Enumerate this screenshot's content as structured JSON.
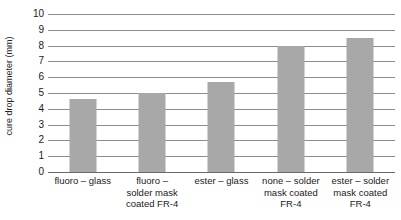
{
  "chart_data": {
    "type": "bar",
    "title": "",
    "xlabel": "",
    "ylabel": "cure drop diameter (mm)",
    "ylim": [
      0,
      10
    ],
    "ytick_step": 1,
    "grid": true,
    "legend": "none",
    "categories": [
      "fluoro – glass",
      "fluoro – solder mask coated FR-4",
      "ester – glass",
      "none – solder mask coated FR-4",
      "ester – solder mask coated FR-4"
    ],
    "category_lines": [
      [
        "fluoro – glass"
      ],
      [
        "fluoro –",
        "solder mask",
        "coated FR-4"
      ],
      [
        "ester – glass"
      ],
      [
        "none – solder",
        "mask coated",
        "FR-4"
      ],
      [
        "ester – solder",
        "mask coated",
        "FR-4"
      ]
    ],
    "values": [
      4.6,
      5.0,
      5.7,
      8.0,
      8.5
    ],
    "ytick_labels": [
      "10",
      "9",
      "8",
      "7",
      "6",
      "5",
      "4",
      "3",
      "2",
      "1",
      "0"
    ],
    "colors": {
      "bar_fill": "#a8a8a8",
      "gridline": "#8d8d8d",
      "axis": "#6a6a6a",
      "text": "#1a1a1a",
      "background": "#ffffff"
    }
  }
}
